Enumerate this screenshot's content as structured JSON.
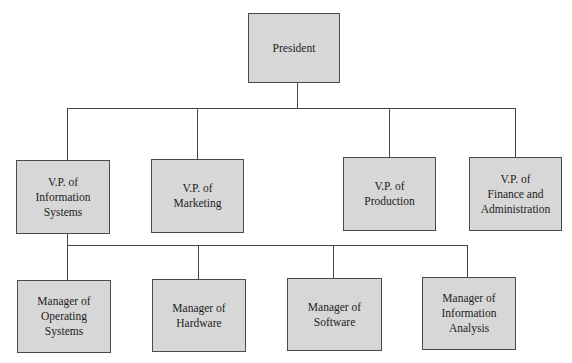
{
  "diagram": {
    "type": "org-chart",
    "colors": {
      "box_fill": "#d7d7d7",
      "box_border": "#4a4a4a",
      "connector": "#444444",
      "text": "#222222"
    },
    "president": {
      "label": "President"
    },
    "vice_presidents": [
      {
        "label": "V.P. of\nInformation\nSystems"
      },
      {
        "label": "V.P. of\nMarketing"
      },
      {
        "label": "V.P. of\nProduction"
      },
      {
        "label": "V.P. of\nFinance and\nAdministration"
      }
    ],
    "managers": [
      {
        "label": "Manager of\nOperating\nSystems",
        "reports_to": "V.P. of Information Systems"
      },
      {
        "label": "Manager of\nHardware",
        "reports_to": "V.P. of Information Systems"
      },
      {
        "label": "Manager of\nSoftware",
        "reports_to": "V.P. of Information Systems"
      },
      {
        "label": "Manager of\nInformation\nAnalysis",
        "reports_to": "V.P. of Information Systems"
      }
    ]
  }
}
